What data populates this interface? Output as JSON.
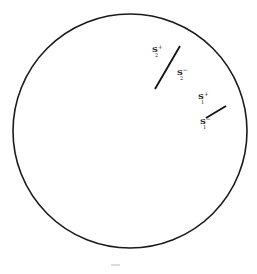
{
  "diagram": {
    "circle": {
      "cx": 130,
      "cy": 131,
      "r": 117,
      "stroke": "#1a1a1a",
      "stroke_width": 1.6
    },
    "segments": [
      {
        "id": "segment-2",
        "x1": 180,
        "y1": 46,
        "x2": 155,
        "y2": 89,
        "label_plus": {
          "base": "S",
          "sup": "+",
          "sub": "2",
          "x": 152,
          "y": 52
        },
        "label_minus": {
          "base": "S",
          "sup": "−",
          "sub": "2",
          "x": 177,
          "y": 75
        }
      },
      {
        "id": "segment-1",
        "x1": 206,
        "y1": 118,
        "x2": 226,
        "y2": 106,
        "label_plus": {
          "base": "S",
          "sup": "+",
          "sub": "1",
          "x": 198,
          "y": 99
        },
        "label_minus": {
          "base": "S",
          "sup": "−",
          "sub": "1",
          "x": 200,
          "y": 124
        }
      }
    ],
    "caption": {
      "text": "—",
      "x": 114,
      "y": 265
    }
  },
  "labels": {
    "s2_plus_base": "S",
    "s2_plus_sup": "+",
    "s2_plus_sub": "2",
    "s2_minus_base": "S",
    "s2_minus_sup": "−",
    "s2_minus_sub": "2",
    "s1_plus_base": "S",
    "s1_plus_sup": "+",
    "s1_plus_sub": "1",
    "s1_minus_base": "S",
    "s1_minus_sup": "−",
    "s1_minus_sub": "1"
  }
}
